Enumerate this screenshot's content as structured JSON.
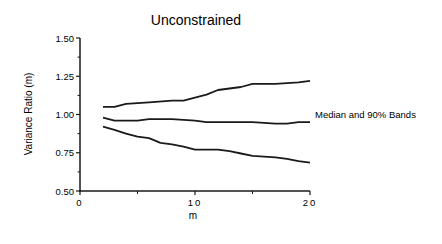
{
  "chart_data": {
    "type": "line",
    "title": "Unconstrained",
    "xlabel": "m",
    "ylabel": "Variance Ratio (m)",
    "xlim": [
      0,
      20
    ],
    "ylim": [
      0.5,
      1.5
    ],
    "x_ticks": [
      0,
      10,
      20
    ],
    "x_tick_labels": [
      "0",
      "10",
      "20"
    ],
    "x_minor_ticks": [
      5,
      15
    ],
    "y_ticks": [
      0.5,
      0.75,
      1.0,
      1.25,
      1.5
    ],
    "y_tick_labels": [
      "0.50",
      "0.75",
      "1.00",
      "1.25",
      "1.50"
    ],
    "y_minor_ticks": [
      0.625,
      0.875,
      1.125,
      1.375
    ],
    "grid": false,
    "annotation": "Median and 90% Bands",
    "series": [
      {
        "name": "Upper 90% band",
        "x": [
          2,
          3,
          4,
          6,
          8,
          9,
          10,
          11,
          12,
          14,
          15,
          17,
          19,
          20
        ],
        "values": [
          1.05,
          1.05,
          1.07,
          1.08,
          1.09,
          1.09,
          1.11,
          1.13,
          1.16,
          1.18,
          1.2,
          1.2,
          1.21,
          1.22
        ]
      },
      {
        "name": "Median",
        "x": [
          2,
          3,
          5,
          6,
          8,
          10,
          11,
          13,
          15,
          16,
          17,
          18,
          19,
          20
        ],
        "values": [
          0.98,
          0.96,
          0.96,
          0.97,
          0.97,
          0.96,
          0.95,
          0.95,
          0.95,
          0.945,
          0.94,
          0.94,
          0.95,
          0.95
        ]
      },
      {
        "name": "Lower 90% band",
        "x": [
          2,
          3,
          4,
          5,
          6,
          7,
          8,
          9,
          10,
          12,
          13,
          14,
          15,
          17,
          18,
          19,
          20
        ],
        "values": [
          0.92,
          0.9,
          0.875,
          0.855,
          0.845,
          0.815,
          0.805,
          0.79,
          0.77,
          0.77,
          0.76,
          0.745,
          0.73,
          0.72,
          0.71,
          0.695,
          0.685
        ]
      }
    ],
    "colors": {
      "line": "#1a1a1a",
      "axis": "#1a1a1a",
      "background": "#ffffff"
    }
  }
}
